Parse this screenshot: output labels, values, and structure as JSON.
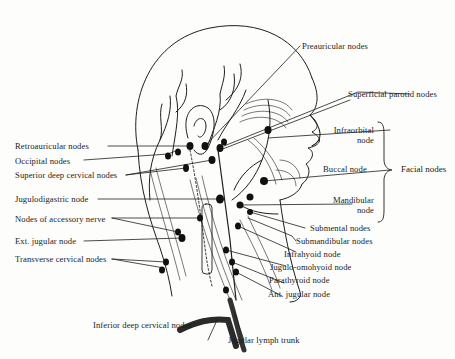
{
  "figure": {
    "labels": {
      "preauricular": "Preauricular nodes",
      "superficial_parotid": "Superficial parotid nodes",
      "infraorbital_1": "Infraorbital",
      "infraorbital_2": "node",
      "buccal": "Buccal node",
      "mandibular_1": "Mandibular",
      "mandibular_2": "node",
      "facial_group": "Facial nodes",
      "retroauricular": "Retroauricular nodes",
      "occipital": "Occipital nodes",
      "superior_deep_cervical": "Superior deep cervical nodes",
      "jugulodigastric": "Jugulodigastric node",
      "accessory_nerve": "Nodes of accessory nerve",
      "ext_jugular": "Ext. jugular node",
      "transverse_cervical": "Transverse cervical nodes",
      "submental": "Submental nodes",
      "submandibular": "Submandibular nodes",
      "infrahyoid": "Infrahyoid node",
      "jugulo_omohyoid": "Jugulo-omohyoid node",
      "parathyroid": "Parathyroid node",
      "ant_jugular": "Ant. jugular node",
      "inferior_deep_cervical": "Inferior deep cervical nodes",
      "jugular_trunk": "Jugular lymph trunk"
    }
  }
}
